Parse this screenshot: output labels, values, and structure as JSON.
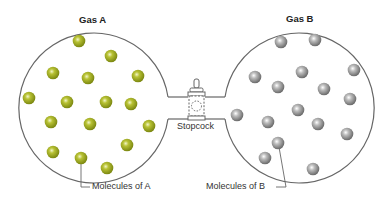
{
  "labels": {
    "gas_a": "Gas A",
    "gas_b": "Gas B",
    "stopcock": "Stopcock",
    "molecules_a": "Molecules of A",
    "molecules_b": "Molecules of B"
  },
  "colors": {
    "molecule_a": "#9aa61c",
    "molecule_b": "#8c8c8c",
    "outline": "#555555"
  },
  "molecules_a": [
    [
      79,
      41
    ],
    [
      111,
      56
    ],
    [
      53,
      73
    ],
    [
      88,
      78
    ],
    [
      138,
      76
    ],
    [
      29,
      98
    ],
    [
      67,
      102
    ],
    [
      106,
      102
    ],
    [
      131,
      104
    ],
    [
      51,
      122
    ],
    [
      90,
      124
    ],
    [
      149,
      126
    ],
    [
      127,
      145
    ],
    [
      53,
      152
    ],
    [
      81,
      158
    ],
    [
      107,
      168
    ]
  ],
  "molecules_b": [
    [
      281,
      42
    ],
    [
      315,
      40
    ],
    [
      255,
      77
    ],
    [
      302,
      72
    ],
    [
      354,
      70
    ],
    [
      278,
      87
    ],
    [
      324,
      89
    ],
    [
      350,
      99
    ],
    [
      237,
      115
    ],
    [
      298,
      110
    ],
    [
      268,
      122
    ],
    [
      318,
      124
    ],
    [
      347,
      134
    ],
    [
      278,
      143
    ],
    [
      265,
      158
    ],
    [
      313,
      169
    ]
  ]
}
